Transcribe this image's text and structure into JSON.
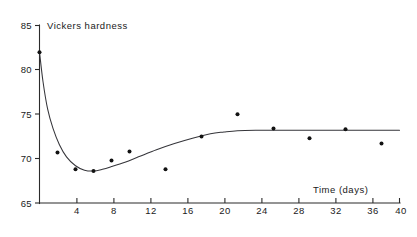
{
  "chart_data": {
    "type": "scatter",
    "title": "",
    "ylabel": "Vickers hardness",
    "xlabel": "Time (days)",
    "xlim": [
      0,
      40
    ],
    "ylim": [
      65,
      85
    ],
    "grid": false,
    "legend": "none",
    "xticks": [
      0,
      4,
      8,
      12,
      16,
      20,
      24,
      28,
      32,
      36,
      40
    ],
    "xtick_labels": [
      "",
      "4",
      "8",
      "12",
      "16",
      "20",
      "24",
      "28",
      "32",
      "36",
      "40"
    ],
    "yticks": [
      65,
      70,
      75,
      80,
      85
    ],
    "ytick_labels": [
      "65",
      "70",
      "75",
      "80",
      "85"
    ],
    "series": [
      {
        "name": "measured hardness",
        "marker": "filled-square-dot",
        "x": [
          0,
          2,
          4,
          6,
          8,
          10,
          14,
          18,
          22,
          26,
          30,
          34,
          38
        ],
        "y": [
          82.0,
          70.7,
          68.8,
          68.6,
          69.8,
          70.8,
          68.8,
          72.5,
          75.0,
          73.4,
          72.3,
          73.3,
          71.7
        ]
      },
      {
        "name": "fitted curve",
        "type": "line",
        "x": [
          0.0,
          0.4,
          0.9,
          1.5,
          2.2,
          3.0,
          4.0,
          5.0,
          6.0,
          7.0,
          8.0,
          9.5,
          11.0,
          13.0,
          15.0,
          17.0,
          19.0,
          20.5,
          22.0,
          24.0,
          28.0,
          32.0,
          36.0,
          40.0
        ],
        "y": [
          82.0,
          78.6,
          75.6,
          73.4,
          71.6,
          70.2,
          69.2,
          68.7,
          68.6,
          68.8,
          69.1,
          69.6,
          70.2,
          71.0,
          71.7,
          72.3,
          72.8,
          73.0,
          73.15,
          73.2,
          73.2,
          73.2,
          73.2,
          73.2
        ]
      }
    ]
  },
  "labels": {
    "y_axis_title": "Vickers hardness",
    "x_axis_title": "Time  (days)",
    "y_65": "65",
    "y_70": "70",
    "y_75": "75",
    "y_80": "80",
    "y_85": "85",
    "x_4": "4",
    "x_8": "8",
    "x_12": "12",
    "x_16": "16",
    "x_20": "20",
    "x_24": "24",
    "x_28": "28",
    "x_32": "32",
    "x_36": "36",
    "x_40": "40"
  }
}
